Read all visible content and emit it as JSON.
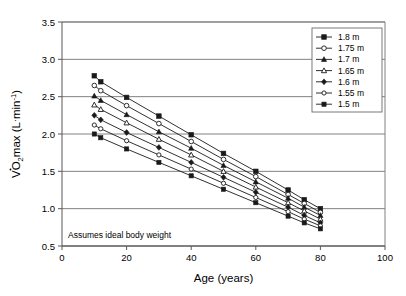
{
  "chart_data": {
    "type": "line",
    "title": "",
    "xlabel": "Age (years)",
    "ylabel": "VO2max (L·min-1)",
    "ylabel_parts": {
      "v_dot": "V",
      "o": "O",
      "sub2": "2",
      "max": "max (L",
      "middot": "·",
      "min": "min",
      "exp": "-1",
      "close": ")"
    },
    "xlim": [
      0,
      100
    ],
    "ylim": [
      0.5,
      3.5
    ],
    "xticks": [
      0,
      20,
      40,
      60,
      80,
      100
    ],
    "yticks": [
      0.5,
      1.0,
      1.5,
      2.0,
      2.5,
      3.0,
      3.5
    ],
    "xtick_labels": [
      "0",
      "20",
      "40",
      "60",
      "80",
      "100"
    ],
    "ytick_labels": [
      "0.5",
      "1.0",
      "1.5",
      "2.0",
      "2.5",
      "3.0",
      "3.5"
    ],
    "grid": "horizontal",
    "legend_position": "top-right",
    "annotation": "Assumes ideal body weight",
    "x": [
      10,
      12,
      20,
      30,
      40,
      50,
      60,
      70,
      75,
      80
    ],
    "series": [
      {
        "name": "1.8 m",
        "marker": "filled-square",
        "values": [
          2.78,
          2.7,
          2.49,
          2.24,
          1.99,
          1.74,
          1.5,
          1.25,
          1.12,
          1.0
        ]
      },
      {
        "name": "1.75 m",
        "marker": "open-circle",
        "values": [
          2.65,
          2.58,
          2.38,
          2.14,
          1.9,
          1.66,
          1.43,
          1.19,
          1.07,
          0.95
        ]
      },
      {
        "name": "1.7 m",
        "marker": "filled-triangle",
        "values": [
          2.51,
          2.45,
          2.26,
          2.03,
          1.81,
          1.58,
          1.36,
          1.14,
          1.02,
          0.91
        ]
      },
      {
        "name": "1.65 m",
        "marker": "open-triangle",
        "values": [
          2.39,
          2.33,
          2.15,
          1.93,
          1.72,
          1.5,
          1.29,
          1.08,
          0.97,
          0.86
        ]
      },
      {
        "name": "1.6 m",
        "marker": "filled-diamond",
        "values": [
          2.25,
          2.19,
          2.02,
          1.82,
          1.62,
          1.42,
          1.22,
          1.02,
          0.91,
          0.81
        ]
      },
      {
        "name": "1.55 m",
        "marker": "open-circle-small",
        "values": [
          2.12,
          2.07,
          1.91,
          1.72,
          1.53,
          1.34,
          1.15,
          0.96,
          0.86,
          0.77
        ]
      },
      {
        "name": "1.5 m",
        "marker": "filled-square-small",
        "values": [
          2.0,
          1.95,
          1.8,
          1.62,
          1.44,
          1.26,
          1.08,
          0.9,
          0.81,
          0.73
        ]
      }
    ],
    "colors": {
      "line": "#1a1a1a",
      "marker_fill": "#1a1a1a",
      "marker_open_fill": "#ffffff",
      "grid": "#808080",
      "axis": "#595959",
      "background": "#ffffff"
    }
  }
}
